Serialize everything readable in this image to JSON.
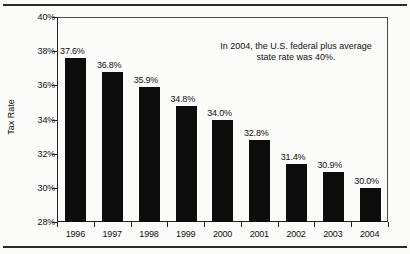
{
  "chart_data": {
    "type": "bar",
    "title": "",
    "xlabel": "",
    "ylabel": "Tax Rate",
    "categories": [
      "1996",
      "1997",
      "1998",
      "1999",
      "2000",
      "2001",
      "2002",
      "2003",
      "2004"
    ],
    "values": [
      37.6,
      36.8,
      35.9,
      34.8,
      34.0,
      32.8,
      31.4,
      30.9,
      30.0
    ],
    "data_labels": [
      "37.6%",
      "36.8%",
      "35.9%",
      "34.8%",
      "34.0%",
      "32.8%",
      "31.4%",
      "30.9%",
      "30.0%"
    ],
    "ylim": [
      28,
      40
    ],
    "ytick_labels": [
      "40%",
      "38%",
      "36%",
      "34%",
      "32%",
      "30%",
      "28%"
    ],
    "ytick_values": [
      40,
      38,
      36,
      34,
      32,
      30,
      28
    ],
    "grid": false,
    "legend": false,
    "bar_color": "#0c0c0c",
    "annotation": {
      "line1": "In 2004, the U.S. federal plus average",
      "line2": "state rate was 40%."
    }
  }
}
